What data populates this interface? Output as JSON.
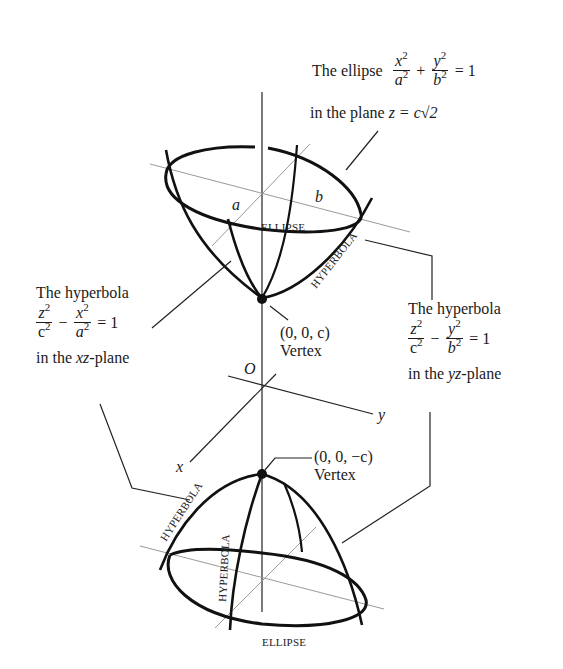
{
  "top_ellipse_label": {
    "prefix": "The ellipse",
    "term1_num": "x",
    "term1_num_exp": "2",
    "term1_den": "a",
    "term1_den_exp": "2",
    "op": "+",
    "term2_num": "y",
    "term2_num_exp": "2",
    "term2_den": "b",
    "term2_den_exp": "2",
    "rhs": "= 1",
    "plane_text": "in the plane",
    "plane_eq": "z = c√2"
  },
  "left_hyperbola_label": {
    "title": "The hyperbola",
    "term1_num": "z",
    "term1_num_exp": "2",
    "term1_den": "c",
    "term1_den_exp": "2",
    "op": "−",
    "term2_num": "x",
    "term2_num_exp": "2",
    "term2_den": "a",
    "term2_den_exp": "2",
    "rhs": "= 1",
    "plane_prefix": "in the",
    "plane_var": "xz",
    "plane_suffix": "-plane"
  },
  "right_hyperbola_label": {
    "title": "The hyperbola",
    "term1_num": "z",
    "term1_num_exp": "2",
    "term1_den": "c",
    "term1_den_exp": "2",
    "op": "−",
    "term2_num": "y",
    "term2_num_exp": "2",
    "term2_den": "b",
    "term2_den_exp": "2",
    "rhs": "= 1",
    "plane_prefix": "in the",
    "plane_var": "yz",
    "plane_suffix": "-plane"
  },
  "upper_vertex": {
    "coords": "(0, 0, c)",
    "label": "Vertex"
  },
  "lower_vertex": {
    "coords": "(0, 0, −c)",
    "label": "Vertex"
  },
  "axes": {
    "origin": "O",
    "x": "x",
    "y": "y"
  },
  "semi_axes": {
    "a": "a",
    "b": "b"
  },
  "curve_labels": {
    "upper_ellipse": "ELLIPSE",
    "upper_hyperbola": "HYPERBOLA",
    "lower_hyperbola_left": "HYPERBOLA",
    "lower_hyperbola_inner": "HYPERBOLA",
    "lower_ellipse": "ELLIPSE"
  }
}
